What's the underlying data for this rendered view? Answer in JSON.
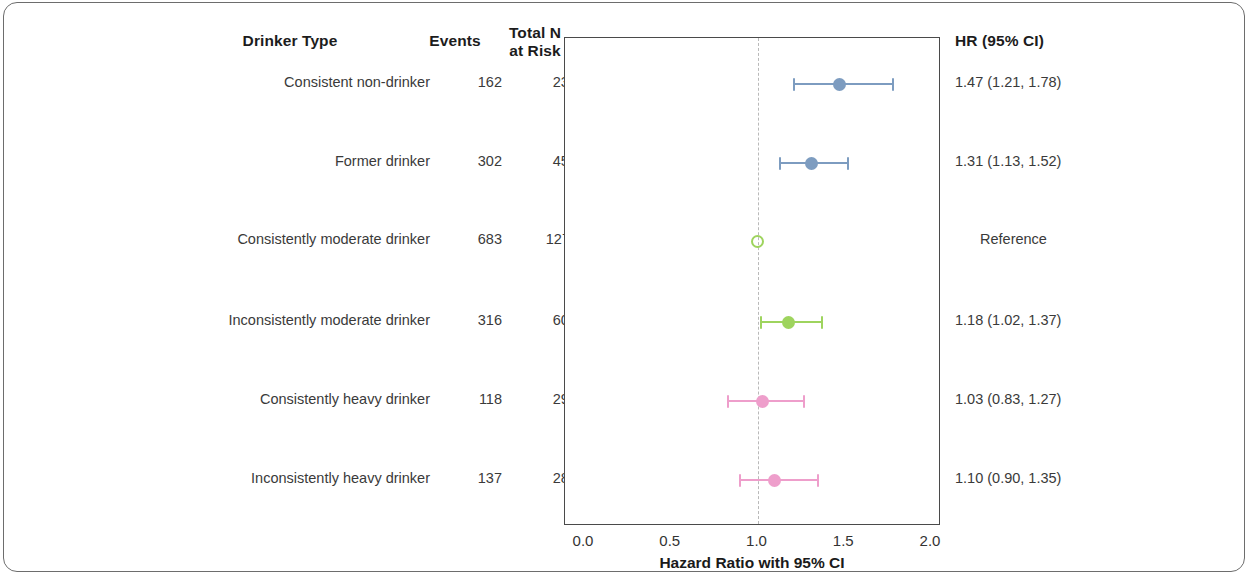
{
  "table": {
    "headers": {
      "drinker_type": "Drinker Type",
      "events": "Events",
      "total_n": "Total N\nat Risk",
      "hr": "HR (95% CI)"
    }
  },
  "axis": {
    "title": "Hazard Ratio with 95% CI",
    "ticks": [
      "0.0",
      "0.5",
      "1.0",
      "1.5",
      "2.0"
    ],
    "tick_values": [
      0.0,
      0.5,
      1.0,
      1.5,
      2.0
    ],
    "xmin": 0.0,
    "xmax": 2.0,
    "reference_value": 1.0
  },
  "colors": {
    "blue": "#7d9cc0",
    "green": "#9ed45e",
    "pink": "#ee9ecb",
    "reference_line": "#b9b9b9",
    "plot_border": "#4a4a4a",
    "figure_border": "#6d6d6d",
    "text": "#3a3a3a",
    "header_text": "#1c1c1c"
  },
  "chart_data": {
    "type": "scatter",
    "title": "",
    "subtitle": "",
    "xlabel": "Hazard Ratio with 95% CI",
    "ylabel": "",
    "xlim": [
      0.0,
      2.0
    ],
    "xticks": [
      0.0,
      0.5,
      1.0,
      1.5,
      2.0
    ],
    "xtick_labels": [
      "0.0",
      "0.5",
      "1.0",
      "1.5",
      "2.0"
    ],
    "grid": false,
    "legend": "none",
    "reference_line_x": 1.0,
    "columns": [
      "Drinker Type",
      "Events",
      "Total N at Risk",
      "HR (95% CI)"
    ],
    "rows": [
      {
        "label": "Consistent non-drinker",
        "events": "162",
        "total_n": "2380",
        "hr_text": "1.47 (1.21, 1.78)",
        "hr": 1.47,
        "ci_low": 1.21,
        "ci_high": 1.78,
        "color": "#7d9cc0",
        "is_reference": false
      },
      {
        "label": "Former drinker",
        "events": "302",
        "total_n": "4504",
        "hr_text": "1.31 (1.13, 1.52)",
        "hr": 1.31,
        "ci_low": 1.13,
        "ci_high": 1.52,
        "color": "#7d9cc0",
        "is_reference": false
      },
      {
        "label": "Consistently moderate drinker",
        "events": "683",
        "total_n": "12711",
        "hr_text": "Reference",
        "hr": 1.0,
        "ci_low": 1.0,
        "ci_high": 1.0,
        "color": "#9ed45e",
        "is_reference": true
      },
      {
        "label": "Inconsistently moderate drinker",
        "events": "316",
        "total_n": "6074",
        "hr_text": "1.18 (1.02, 1.37)",
        "hr": 1.18,
        "ci_low": 1.02,
        "ci_high": 1.37,
        "color": "#9ed45e",
        "is_reference": false
      },
      {
        "label": "Consistently heavy drinker",
        "events": "118",
        "total_n": "2964",
        "hr_text": "1.03 (0.83, 1.27)",
        "hr": 1.03,
        "ci_low": 0.83,
        "ci_high": 1.27,
        "color": "#ee9ecb",
        "is_reference": false
      },
      {
        "label": "Inconsistently heavy drinker",
        "events": "137",
        "total_n": "2824",
        "hr_text": "1.10 (0.90, 1.35)",
        "hr": 1.1,
        "ci_low": 0.9,
        "ci_high": 1.35,
        "color": "#ee9ecb",
        "is_reference": false
      }
    ]
  }
}
